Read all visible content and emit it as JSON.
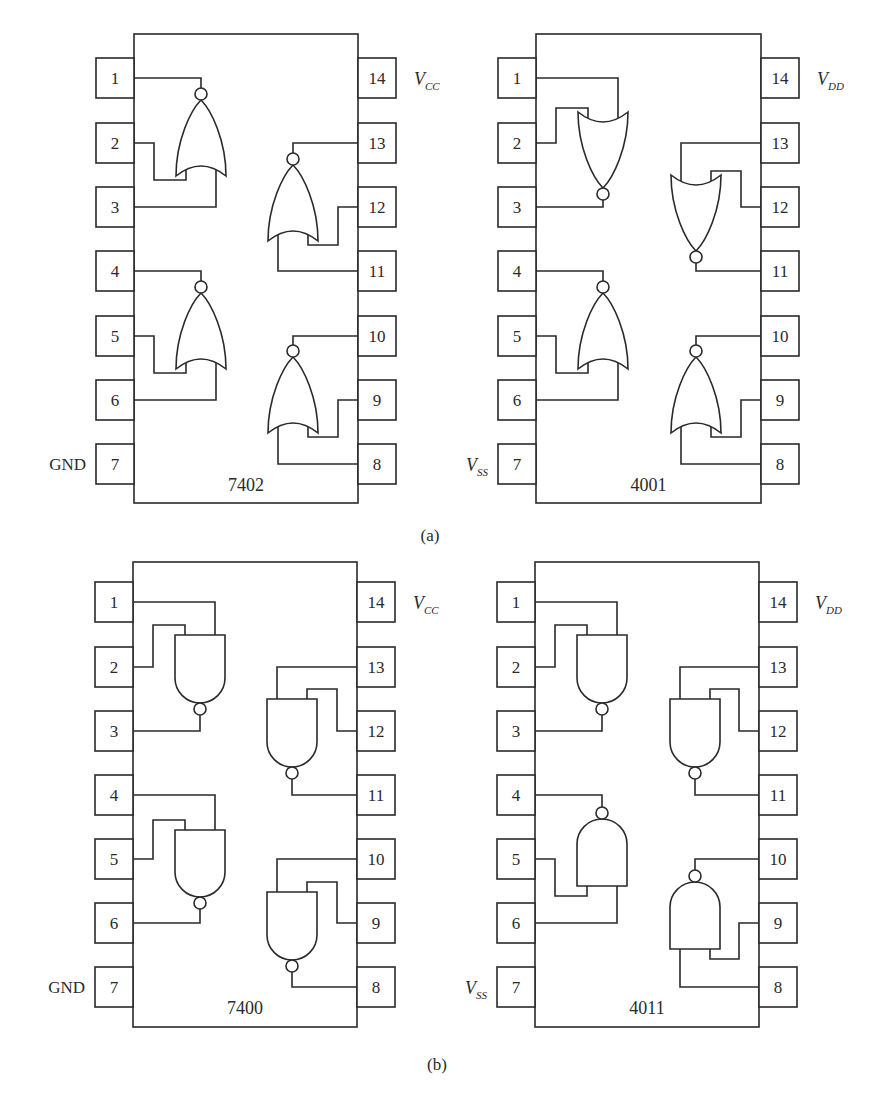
{
  "figure": {
    "captions": [
      {
        "id": "a",
        "text": "(a)",
        "x": 430,
        "y": 541
      },
      {
        "id": "b",
        "text": "(b)",
        "x": 437,
        "y": 1070
      }
    ],
    "colors": {
      "stroke": "#2a2a2a",
      "background": "#ffffff"
    }
  },
  "chips": [
    {
      "id": "7402",
      "part": "7402",
      "gate_type": "NOR",
      "family": "TTL",
      "body": {
        "x": 134,
        "y": 34,
        "w": 224,
        "h": 469
      },
      "pin_y": [
        78,
        143,
        207,
        271,
        336,
        400,
        464
      ],
      "label_y": 491,
      "power_label": {
        "main": "V",
        "sub": "CC"
      },
      "ground_label": {
        "main": "GND",
        "sub": ""
      },
      "gates": [
        {
          "side": "left",
          "orient": "up",
          "cx": 201,
          "top": 100,
          "bottom": 176,
          "inputs": [
            2,
            3
          ],
          "output": 1
        },
        {
          "side": "left",
          "orient": "up",
          "cx": 201,
          "top": 293,
          "bottom": 369,
          "inputs": [
            5,
            6
          ],
          "output": 4
        },
        {
          "side": "right",
          "orient": "up",
          "cx": 293,
          "top": 165,
          "bottom": 241,
          "inputs": [
            11,
            12
          ],
          "output": 13
        },
        {
          "side": "right",
          "orient": "up",
          "cx": 293,
          "top": 357,
          "bottom": 433,
          "inputs": [
            8,
            9
          ],
          "output": 10
        }
      ]
    },
    {
      "id": "4001",
      "part": "4001",
      "gate_type": "NOR",
      "family": "CMOS",
      "body": {
        "x": 536,
        "y": 34,
        "w": 225,
        "h": 469
      },
      "pin_y": [
        78,
        143,
        207,
        271,
        336,
        400,
        464
      ],
      "label_y": 491,
      "power_label": {
        "main": "V",
        "sub": "DD"
      },
      "ground_label": {
        "main": "V",
        "sub": "SS"
      },
      "gates": [
        {
          "side": "left",
          "orient": "down",
          "cx": 603,
          "top": 112,
          "bottom": 188,
          "inputs": [
            1,
            2
          ],
          "output": 3
        },
        {
          "side": "left",
          "orient": "up",
          "cx": 603,
          "top": 293,
          "bottom": 369,
          "inputs": [
            5,
            6
          ],
          "output": 4
        },
        {
          "side": "right",
          "orient": "down",
          "cx": 696,
          "top": 175,
          "bottom": 251,
          "inputs": [
            12,
            13
          ],
          "output": 11
        },
        {
          "side": "right",
          "orient": "up",
          "cx": 696,
          "top": 357,
          "bottom": 433,
          "inputs": [
            8,
            9
          ],
          "output": 10
        }
      ]
    },
    {
      "id": "7400",
      "part": "7400",
      "gate_type": "NAND",
      "family": "TTL",
      "body": {
        "x": 133,
        "y": 562,
        "w": 224,
        "h": 465
      },
      "pin_y": [
        602,
        667,
        731,
        795,
        859,
        923,
        987
      ],
      "label_y": 1014,
      "power_label": {
        "main": "V",
        "sub": "CC"
      },
      "ground_label": {
        "main": "GND",
        "sub": ""
      },
      "gates": [
        {
          "side": "left",
          "orient": "down",
          "cx": 200,
          "top": 635,
          "bottom": 703,
          "inputs": [
            1,
            2
          ],
          "output": 3
        },
        {
          "side": "left",
          "orient": "down",
          "cx": 200,
          "top": 830,
          "bottom": 897,
          "inputs": [
            4,
            5
          ],
          "output": 6
        },
        {
          "side": "right",
          "orient": "down",
          "cx": 292,
          "top": 699,
          "bottom": 767,
          "inputs": [
            12,
            13
          ],
          "output": 11
        },
        {
          "side": "right",
          "orient": "down",
          "cx": 292,
          "top": 892,
          "bottom": 960,
          "inputs": [
            9,
            10
          ],
          "output": 8
        }
      ]
    },
    {
      "id": "4011",
      "part": "4011",
      "gate_type": "NAND",
      "family": "CMOS",
      "body": {
        "x": 535,
        "y": 562,
        "w": 224,
        "h": 465
      },
      "pin_y": [
        602,
        667,
        731,
        795,
        859,
        923,
        987
      ],
      "label_y": 1014,
      "power_label": {
        "main": "V",
        "sub": "DD"
      },
      "ground_label": {
        "main": "V",
        "sub": "SS"
      },
      "gates": [
        {
          "side": "left",
          "orient": "down",
          "cx": 602,
          "top": 635,
          "bottom": 703,
          "inputs": [
            1,
            2
          ],
          "output": 3
        },
        {
          "side": "left",
          "orient": "up",
          "cx": 602,
          "top": 819,
          "bottom": 886,
          "inputs": [
            5,
            6
          ],
          "output": 4
        },
        {
          "side": "right",
          "orient": "down",
          "cx": 695,
          "top": 699,
          "bottom": 767,
          "inputs": [
            12,
            13
          ],
          "output": 11
        },
        {
          "side": "right",
          "orient": "up",
          "cx": 695,
          "top": 882,
          "bottom": 949,
          "inputs": [
            8,
            9
          ],
          "output": 10
        }
      ]
    }
  ]
}
